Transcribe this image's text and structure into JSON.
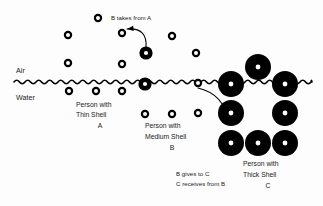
{
  "diagram": {
    "background_color": "#fdfdfd",
    "ink_color": "#000000"
  },
  "labels": {
    "air": "Air",
    "water": "Water",
    "annotation_top": "B takes from A",
    "person_a_line1": "Person with",
    "person_a_line2": "Thin Shell",
    "person_a_line3": "A",
    "person_b_line1": "Person with",
    "person_b_line2": "Medium Shell",
    "person_b_line3": "B",
    "person_c_line1": "Person with",
    "person_c_line2": "Thick Shell",
    "person_c_line3": "C",
    "annotation_bottom_line1": "B gives to C",
    "annotation_bottom_line2": "C receives from B"
  },
  "chart_data": {
    "type": "scatter",
    "xlabel": "",
    "ylabel": "",
    "xlim": [
      0,
      323
    ],
    "ylim": [
      0,
      206
    ],
    "grid": false,
    "legend": "none",
    "annotations": [
      {
        "name": "air-label",
        "text": "Air",
        "x": 16,
        "y": 72
      },
      {
        "name": "water-label",
        "text": "Water",
        "x": 16,
        "y": 99
      },
      {
        "name": "b-takes-from-a",
        "text": "B takes from A",
        "x": 111,
        "y": 20
      },
      {
        "name": "person-a",
        "text": "Person with Thin Shell A",
        "x": 76,
        "y": 107
      },
      {
        "name": "person-b",
        "text": "Person with Medium Shell B",
        "x": 145,
        "y": 128
      },
      {
        "name": "person-c",
        "text": "Person with Thick Shell C",
        "x": 243,
        "y": 166
      },
      {
        "name": "b-gives-to-c",
        "text": "B gives to C / C receives from B",
        "x": 185,
        "y": 176
      }
    ],
    "series": [
      {
        "name": "thin-shell-small-circles",
        "shell_class": "thin",
        "outer_radius": 4.2,
        "inner_radius": 2.0,
        "points": [
          {
            "x": 98,
            "y": 18
          },
          {
            "x": 68,
            "y": 35
          },
          {
            "x": 122,
            "y": 33
          },
          {
            "x": 172,
            "y": 36
          },
          {
            "x": 68,
            "y": 63
          },
          {
            "x": 122,
            "y": 64
          },
          {
            "x": 196,
            "y": 53
          },
          {
            "x": 69,
            "y": 91
          },
          {
            "x": 96,
            "y": 91
          },
          {
            "x": 122,
            "y": 91
          },
          {
            "x": 198,
            "y": 83
          },
          {
            "x": 145,
            "y": 114
          },
          {
            "x": 172,
            "y": 114
          },
          {
            "x": 198,
            "y": 113
          }
        ]
      },
      {
        "name": "medium-shell-circles",
        "shell_class": "medium",
        "outer_radius": 6.6,
        "inner_radius": 2.1,
        "points": [
          {
            "x": 146,
            "y": 53
          },
          {
            "x": 145,
            "y": 84
          }
        ]
      },
      {
        "name": "thick-shell-circles",
        "shell_class": "thick",
        "outer_radius": 13.0,
        "inner_radius": 2.4,
        "points": [
          {
            "x": 258,
            "y": 67
          },
          {
            "x": 231,
            "y": 84
          },
          {
            "x": 285,
            "y": 84
          },
          {
            "x": 231,
            "y": 113
          },
          {
            "x": 285,
            "y": 113
          },
          {
            "x": 231,
            "y": 143
          },
          {
            "x": 258,
            "y": 143
          },
          {
            "x": 285,
            "y": 143
          }
        ]
      }
    ],
    "water_line": {
      "name": "air-water-interface",
      "y": 82,
      "x_start": 14,
      "x_end": 312,
      "wavelength": 11,
      "amplitude": 3.4
    },
    "arrows": [
      {
        "name": "arrow-b-takes-from-a",
        "from": {
          "x": 146,
          "y": 48
        },
        "to": {
          "x": 127,
          "y": 29
        },
        "curve": "arc-up-left"
      },
      {
        "name": "arrow-b-gives-to-c",
        "from": {
          "x": 198,
          "y": 88
        },
        "to": {
          "x": 228,
          "y": 122
        },
        "curve": "arc-down-right"
      }
    ]
  }
}
